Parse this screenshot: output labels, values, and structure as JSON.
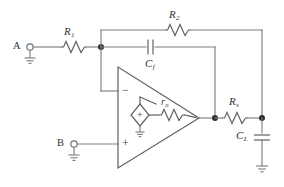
{
  "figure": {
    "type": "circuit-schematic",
    "background_color": "#ffffff",
    "wire_color": "#7a7f86",
    "component_color": "#5d6268",
    "node_color": "#2b2f33",
    "label_color": "#2e3236"
  },
  "terminals": [
    {
      "id": "A",
      "label": "A",
      "x": 14,
      "y": 47
    },
    {
      "id": "B",
      "label": "B",
      "x": 58,
      "y": 144
    }
  ],
  "components": [
    {
      "id": "R1",
      "type": "resistor",
      "label_base": "R",
      "label_sub": "1"
    },
    {
      "id": "R2",
      "type": "resistor",
      "label_base": "R",
      "label_sub": "2"
    },
    {
      "id": "Cf",
      "type": "capacitor",
      "label_base": "C",
      "label_sub": "f"
    },
    {
      "id": "ro",
      "type": "resistor",
      "label_base": "r",
      "label_sub": "o"
    },
    {
      "id": "Rs",
      "type": "resistor",
      "label_base": "R",
      "label_sub": "s"
    },
    {
      "id": "CL",
      "type": "capacitor",
      "label_base": "C",
      "label_sub": "L"
    }
  ],
  "opamp": {
    "inverting_input_sign": "−",
    "noninverting_input_sign": "+",
    "dependent_source_sign": "+",
    "dependent_source_shape": "diamond"
  },
  "grounds": [
    {
      "id": "gnd-a",
      "attached_to": "A"
    },
    {
      "id": "gnd-b",
      "attached_to": "B"
    },
    {
      "id": "gnd-src",
      "attached_to": "dependent-source"
    },
    {
      "id": "gnd-load",
      "attached_to": "CL"
    }
  ],
  "nodes": [
    {
      "id": "inverting-node",
      "x": 101,
      "y": 47
    },
    {
      "id": "output-node",
      "x": 215,
      "y": 118
    },
    {
      "id": "load-node",
      "x": 262,
      "y": 118
    }
  ]
}
